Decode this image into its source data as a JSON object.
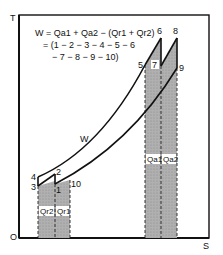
{
  "diagram": {
    "type": "T-S diagram",
    "axes": {
      "y_label": "T",
      "x_label": "S",
      "origin_label": "O"
    },
    "equation": {
      "line1": "W = Qa1 + Qa2 − (Qr1 + Qr2)",
      "line2": "= (1 − 2 − 3 − 4 − 5 − 6",
      "line3": "− 7 − 8 − 9 − 10)"
    },
    "work_label": "W",
    "points": [
      {
        "id": "1",
        "label": "1"
      },
      {
        "id": "2",
        "label": "2"
      },
      {
        "id": "3",
        "label": "3"
      },
      {
        "id": "4",
        "label": "4"
      },
      {
        "id": "5",
        "label": "5"
      },
      {
        "id": "6",
        "label": "6"
      },
      {
        "id": "7",
        "label": "7"
      },
      {
        "id": "8",
        "label": "8"
      },
      {
        "id": "9",
        "label": "9"
      },
      {
        "id": "10",
        "label": "10"
      }
    ],
    "heat_areas": {
      "qr2": "Qr2",
      "qr1": "Qr1",
      "qa1": "Qa1",
      "qa2": "Qa2"
    },
    "colors": {
      "shade": "#a8a8a8",
      "line": "#111111",
      "frame": "#111111"
    }
  }
}
